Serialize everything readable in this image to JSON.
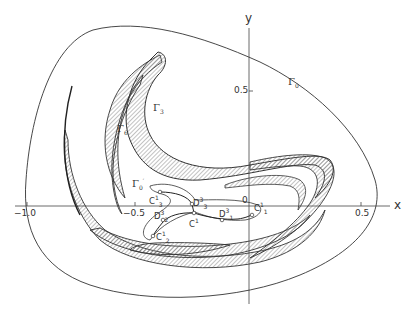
{
  "figure": {
    "axes": {
      "x_label": "x",
      "y_label": "y",
      "x_ticks": [
        {
          "value": "-1.0",
          "label": "−1.0"
        },
        {
          "value": "-0.5",
          "label": "−0.5"
        },
        {
          "value": "0",
          "label": "0"
        },
        {
          "value": "0.5",
          "label": "0.5"
        }
      ],
      "y_ticks": [
        {
          "value": "0.5",
          "label": "0.5"
        }
      ],
      "origin_label": "0"
    },
    "curves": {
      "gamma0": {
        "name": "Γ",
        "sub": "0",
        "sup": ""
      },
      "gamma3": {
        "name": "Γ",
        "sub": "3",
        "sup": ""
      },
      "gamma6p": {
        "name": "Γ",
        "sub": "6",
        "sup": "′"
      },
      "gamma0p": {
        "name": "Γ",
        "sub": "0",
        "sup": "′"
      }
    },
    "points": {
      "C3_1": {
        "name": "C",
        "sup": "1",
        "sub": "3"
      },
      "D3_3": {
        "name": "D",
        "sup": "3",
        "sub": "3"
      },
      "D2_3": {
        "name": "D",
        "sup": "3",
        "sub": "2"
      },
      "C1": {
        "name": "C",
        "sup": "1",
        "sub": ""
      },
      "D1_3": {
        "name": "D",
        "sup": "3",
        "sub": "1"
      },
      "C1_1": {
        "name": "C",
        "sup": "1",
        "sub": "1"
      },
      "C2_1": {
        "name": "C",
        "sup": "1",
        "sub": "2"
      }
    },
    "colors": {
      "line": "#333333",
      "hatch": "#555555",
      "background": "#ffffff"
    }
  }
}
